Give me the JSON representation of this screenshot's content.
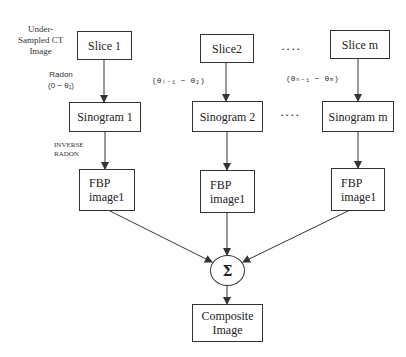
{
  "input_label": {
    "line1": "Under-",
    "line2": "Sampled CT",
    "line3": "Image"
  },
  "columns": [
    {
      "slice": "Slice 1",
      "radon_label": "Radon",
      "angle_range": "(0 − θ₁)",
      "sinogram": "Sinogram 1",
      "inverse_label": {
        "line1": "INVERSE",
        "line2": "RADON"
      },
      "fbp": {
        "line1": "FBP",
        "line2": "image1"
      }
    },
    {
      "slice": "Slice2",
      "angle_range": "(θᵢ₋₁ − θ₂)",
      "sinogram": "Sinogram 2",
      "fbp": {
        "line1": "FBP",
        "line2": "image1"
      }
    },
    {
      "slice": "Slice m",
      "angle_range": "(θₙ₋₁ − θₘ)",
      "sinogram": "Sinogram m",
      "fbp": {
        "line1": "FBP",
        "line2": "image1"
      }
    }
  ],
  "ellipsis": "••••",
  "sum_node": {
    "symbol": "Σ",
    "icon": "sigma-summation-icon"
  },
  "output": {
    "line1": "Composite",
    "line2": "Image"
  },
  "colors": {
    "stroke": "#333333",
    "background": "#ffffff",
    "text": "#222222"
  }
}
